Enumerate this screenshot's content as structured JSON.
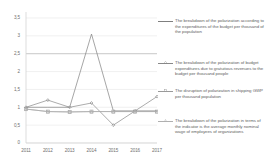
{
  "chart_data": {
    "type": "line",
    "title": "",
    "xlabel": "",
    "ylabel": "",
    "categories": [
      "2011",
      "2012",
      "2013",
      "2014",
      "2015",
      "2016",
      "2017"
    ],
    "ylim": [
      0,
      3.5
    ],
    "yticks": [
      "0",
      "0,5",
      "1",
      "1,5",
      "2",
      "2,5",
      "3",
      "3,5"
    ],
    "ytick_values": [
      0,
      0.5,
      1,
      1.5,
      2,
      2.5,
      3,
      3.5
    ],
    "grid": true,
    "legend_position": "right",
    "series": [
      {
        "name": "The breakdown of the polarization according to the expenditures of the budget per thousand of the population",
        "color": "#7f7f7f",
        "marker": "none",
        "values": [
          1.0,
          1.0,
          1.0,
          3.05,
          0.9,
          0.9,
          0.9
        ]
      },
      {
        "name": "The breakdown of the polarization of budget expenditures due to gratuitous revenues to the budget per thousand people",
        "color": "#888888",
        "marker": "diamond",
        "values": [
          1.0,
          1.2,
          1.0,
          1.12,
          0.5,
          0.9,
          1.3
        ]
      },
      {
        "name": "The disruption of polarization in shipping GWP per thousand population",
        "color": "#9a9a9a",
        "marker": "square",
        "values": [
          0.95,
          0.88,
          0.87,
          0.88,
          0.88,
          0.88,
          0.88
        ]
      },
      {
        "name": "The breakdown of the polarization in terms of the indicator is the average monthly nominal wage of employees of organizations",
        "color": "#b0b0b0",
        "marker": "triangle",
        "values": [
          0.95,
          0.88,
          0.87,
          0.88,
          0.88,
          0.88,
          0.88
        ]
      }
    ]
  },
  "colors": {
    "axis": "#d4d4d4",
    "grid": "#e6e6e6",
    "grid_strong": "#b9b9b9",
    "tick_text": "#6f6f6f",
    "legend_text": "#5f5f5f",
    "background": "#ffffff"
  }
}
